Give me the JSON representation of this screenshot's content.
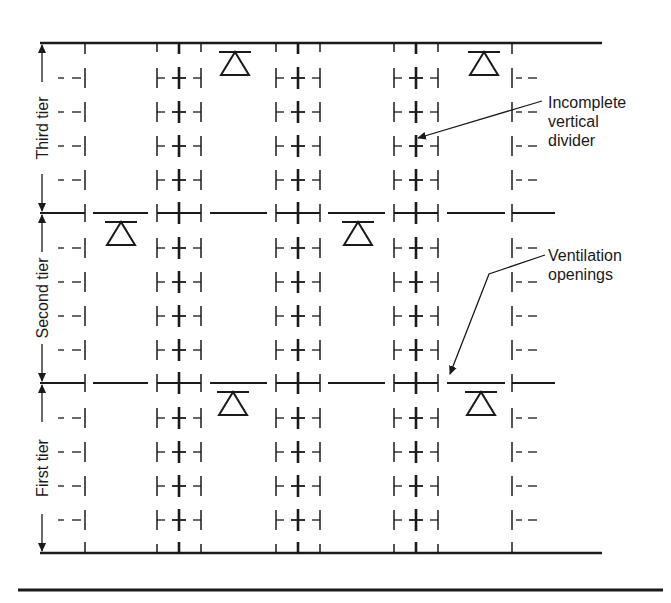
{
  "diagram": {
    "tiers": [
      {
        "label": "Third tier"
      },
      {
        "label": "Second tier"
      },
      {
        "label": "First tier"
      }
    ],
    "callouts": [
      {
        "lines": [
          "Incomplete",
          "vertical",
          "divider"
        ]
      },
      {
        "lines": [
          "Ventilation",
          "openings"
        ]
      }
    ],
    "colors": {
      "ink": "#1a1a1a",
      "background": "#ffffff"
    }
  }
}
